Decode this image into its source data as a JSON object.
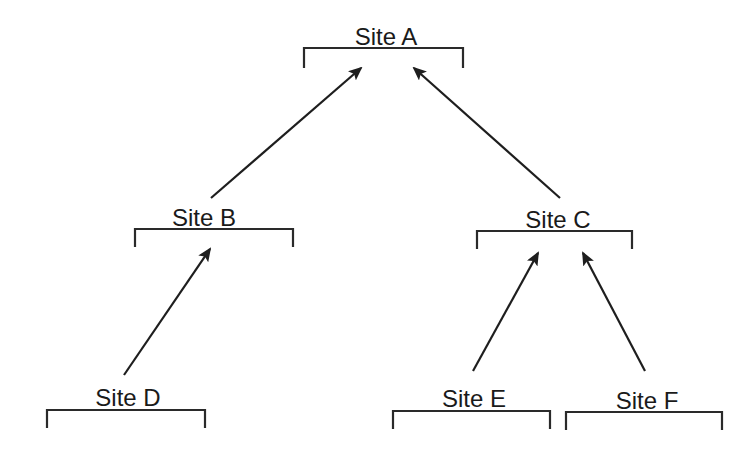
{
  "diagram": {
    "type": "hierarchy",
    "direction": "bottom-up arrows (child points to parent)",
    "colors": {
      "background": "#ffffff",
      "stroke": "#1e1e1e",
      "text": "#1a1a1a"
    },
    "nodes": [
      {
        "id": "A",
        "label": "Site A",
        "level": 0,
        "bracket": {
          "x1": 304,
          "x2": 463,
          "y": 48,
          "drop": 20
        },
        "label_pos": {
          "x": 386,
          "y": 45
        }
      },
      {
        "id": "B",
        "label": "Site B",
        "level": 1,
        "bracket": {
          "x1": 135,
          "x2": 293,
          "y": 229,
          "drop": 18
        },
        "label_pos": {
          "x": 204,
          "y": 226
        }
      },
      {
        "id": "C",
        "label": "Site C",
        "level": 1,
        "bracket": {
          "x1": 477,
          "x2": 632,
          "y": 231,
          "drop": 18
        },
        "label_pos": {
          "x": 558,
          "y": 228
        }
      },
      {
        "id": "D",
        "label": "Site D",
        "level": 2,
        "bracket": {
          "x1": 47,
          "x2": 205,
          "y": 410,
          "drop": 18
        },
        "label_pos": {
          "x": 128,
          "y": 406
        }
      },
      {
        "id": "E",
        "label": "Site E",
        "level": 2,
        "bracket": {
          "x1": 393,
          "x2": 550,
          "y": 411,
          "drop": 18
        },
        "label_pos": {
          "x": 474,
          "y": 407
        }
      },
      {
        "id": "F",
        "label": "Site F",
        "level": 2,
        "bracket": {
          "x1": 566,
          "x2": 722,
          "y": 412,
          "drop": 18
        },
        "label_pos": {
          "x": 647,
          "y": 409
        }
      }
    ],
    "edges": [
      {
        "from": "B",
        "to": "A",
        "x1": 211,
        "y1": 198,
        "x2": 361,
        "y2": 68
      },
      {
        "from": "C",
        "to": "A",
        "x1": 560,
        "y1": 198,
        "x2": 414,
        "y2": 68
      },
      {
        "from": "D",
        "to": "B",
        "x1": 124,
        "y1": 375,
        "x2": 210,
        "y2": 249
      },
      {
        "from": "E",
        "to": "C",
        "x1": 473,
        "y1": 371,
        "x2": 538,
        "y2": 253
      },
      {
        "from": "F",
        "to": "C",
        "x1": 645,
        "y1": 371,
        "x2": 583,
        "y2": 253
      }
    ]
  }
}
